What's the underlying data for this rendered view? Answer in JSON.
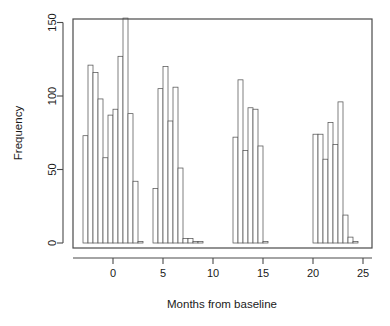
{
  "chart_data": {
    "type": "bar",
    "title": "",
    "subtitle": "",
    "xlabel": "Months from baseline",
    "ylabel": "Frequency",
    "xlim": [
      -3.6,
      25.6
    ],
    "ylim": [
      0,
      158
    ],
    "grid": false,
    "legend": null,
    "bin_width": 0.5,
    "x_ticks": [
      0,
      5,
      10,
      15,
      20,
      25
    ],
    "x_tick_labels": [
      "0",
      "5",
      "10",
      "15",
      "20",
      "25"
    ],
    "y_ticks": [
      0,
      50,
      100,
      150
    ],
    "y_tick_labels": [
      "0",
      "50",
      "100",
      "150"
    ],
    "bar_fill": "#ffffff",
    "bar_stroke": "#555555",
    "axis_color": "#4a4a4a",
    "bins": [
      {
        "x0": -3.0,
        "x1": -2.5,
        "value": 73
      },
      {
        "x0": -2.5,
        "x1": -2.0,
        "value": 121
      },
      {
        "x0": -2.0,
        "x1": -1.5,
        "value": 116
      },
      {
        "x0": -1.5,
        "x1": -1.0,
        "value": 98
      },
      {
        "x0": -1.0,
        "x1": -0.5,
        "value": 58
      },
      {
        "x0": -0.5,
        "x1": 0.0,
        "value": 87
      },
      {
        "x0": 0.0,
        "x1": 0.5,
        "value": 91
      },
      {
        "x0": 0.5,
        "x1": 1.0,
        "value": 127
      },
      {
        "x0": 1.0,
        "x1": 1.5,
        "value": 153
      },
      {
        "x0": 1.5,
        "x1": 2.0,
        "value": 88
      },
      {
        "x0": 2.0,
        "x1": 2.5,
        "value": 42
      },
      {
        "x0": 2.5,
        "x1": 3.0,
        "value": 1
      },
      {
        "x0": 4.0,
        "x1": 4.5,
        "value": 37
      },
      {
        "x0": 4.5,
        "x1": 5.0,
        "value": 105
      },
      {
        "x0": 5.0,
        "x1": 5.5,
        "value": 120
      },
      {
        "x0": 5.5,
        "x1": 6.0,
        "value": 83
      },
      {
        "x0": 6.0,
        "x1": 6.5,
        "value": 106
      },
      {
        "x0": 6.5,
        "x1": 7.0,
        "value": 51
      },
      {
        "x0": 7.0,
        "x1": 7.5,
        "value": 3
      },
      {
        "x0": 7.5,
        "x1": 8.0,
        "value": 3
      },
      {
        "x0": 8.0,
        "x1": 8.5,
        "value": 1
      },
      {
        "x0": 8.5,
        "x1": 9.0,
        "value": 1
      },
      {
        "x0": 12.0,
        "x1": 12.5,
        "value": 72
      },
      {
        "x0": 12.5,
        "x1": 13.0,
        "value": 111
      },
      {
        "x0": 13.0,
        "x1": 13.5,
        "value": 63
      },
      {
        "x0": 13.5,
        "x1": 14.0,
        "value": 92
      },
      {
        "x0": 14.0,
        "x1": 14.5,
        "value": 91
      },
      {
        "x0": 14.5,
        "x1": 15.0,
        "value": 66
      },
      {
        "x0": 15.0,
        "x1": 15.5,
        "value": 1
      },
      {
        "x0": 20.0,
        "x1": 20.5,
        "value": 74
      },
      {
        "x0": 20.5,
        "x1": 21.0,
        "value": 74
      },
      {
        "x0": 21.0,
        "x1": 21.5,
        "value": 57
      },
      {
        "x0": 21.5,
        "x1": 22.0,
        "value": 82
      },
      {
        "x0": 22.0,
        "x1": 22.5,
        "value": 67
      },
      {
        "x0": 22.5,
        "x1": 23.0,
        "value": 96
      },
      {
        "x0": 23.0,
        "x1": 23.5,
        "value": 19
      },
      {
        "x0": 23.5,
        "x1": 24.0,
        "value": 4
      },
      {
        "x0": 24.0,
        "x1": 24.5,
        "value": 1
      }
    ]
  }
}
